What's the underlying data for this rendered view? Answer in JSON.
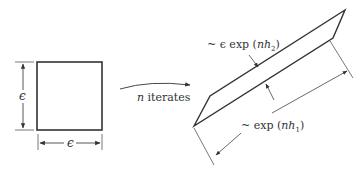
{
  "diagram": {
    "square": {
      "width_label": "ϵ",
      "height_label": "ϵ"
    },
    "transition": {
      "label_var": "n",
      "label_text": " iterates"
    },
    "parallelogram": {
      "thickness_label_prefix": "~ ϵ exp (",
      "thickness_label_var": "nh",
      "thickness_label_sub": "2",
      "thickness_label_suffix": ")",
      "length_label_prefix": "~ exp (",
      "length_label_var": "nh",
      "length_label_sub": "1",
      "length_label_suffix": ")"
    },
    "colors": {
      "stroke": "#333333",
      "dim": "#555555"
    }
  }
}
